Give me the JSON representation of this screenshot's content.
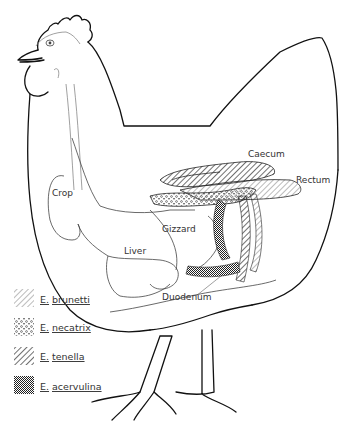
{
  "figure": {
    "organs": [
      {
        "id": "crop",
        "label": "Crop"
      },
      {
        "id": "liver",
        "label": "Liver"
      },
      {
        "id": "gizzard",
        "label": "Gizzard"
      },
      {
        "id": "duodenum",
        "label": "Duodenum"
      },
      {
        "id": "caecum",
        "label": "Caecum"
      },
      {
        "id": "rectum",
        "label": "Rectum"
      }
    ],
    "legend": [
      {
        "genus": "E.",
        "species": "brunetti",
        "pattern": "diagonal-hatch-fine"
      },
      {
        "genus": "E.",
        "species": "necatrix",
        "pattern": "dots"
      },
      {
        "genus": "E.",
        "species": "tenella",
        "pattern": "diagonal-hatch-bold"
      },
      {
        "genus": "E.",
        "species": "acervulina",
        "pattern": "crosshatch-dense"
      }
    ],
    "colors": {
      "ink": "#111111",
      "background": "#ffffff"
    }
  }
}
